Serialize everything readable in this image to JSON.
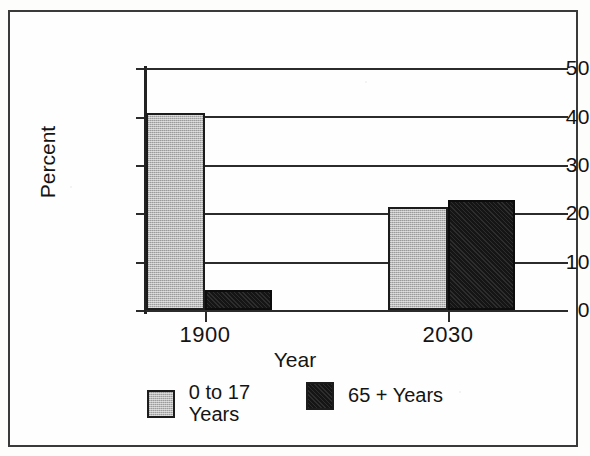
{
  "chart_data": {
    "type": "bar",
    "title": "",
    "xlabel": "Year",
    "ylabel": "Percent",
    "categories": [
      "1900",
      "2030"
    ],
    "series": [
      {
        "name": "0 to 17\nYears",
        "color": "#b9b9b9",
        "values": [
          40.8,
          21.2
        ]
      },
      {
        "name": "65 + Years",
        "color": "#151515",
        "values": [
          4.1,
          22.8
        ]
      }
    ],
    "ylim": [
      0,
      50
    ],
    "yticks": [
      0,
      10,
      20,
      30,
      40,
      50
    ],
    "ytick_labels": [
      "0",
      "10",
      "20",
      "30",
      "40",
      "50"
    ],
    "grid": true,
    "legend_position": "bottom"
  },
  "axis": {
    "y_title": "Percent",
    "x_title": "Year",
    "y_ticks": [
      {
        "label": "50",
        "value": 50
      },
      {
        "label": "40",
        "value": 40
      },
      {
        "label": "30",
        "value": 30
      },
      {
        "label": "20",
        "value": 20
      },
      {
        "label": "10",
        "value": 10
      },
      {
        "label": "0",
        "value": 0
      }
    ],
    "x_ticks": [
      {
        "label": "1900"
      },
      {
        "label": "2030"
      }
    ]
  },
  "legend": {
    "items": [
      {
        "label": "0 to 17\nYears",
        "swatch": "gray"
      },
      {
        "label": "65 + Years",
        "swatch": "black"
      }
    ]
  }
}
